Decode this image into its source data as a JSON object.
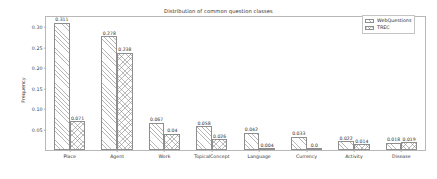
{
  "chart_data": {
    "type": "bar",
    "title": "Distribution of common question classes",
    "xlabel": "",
    "ylabel": "Frequency",
    "categories": [
      "Place",
      "Agent",
      "Work",
      "TopicalConcept",
      "Language",
      "Currency",
      "Activity",
      "Disease"
    ],
    "series": [
      {
        "name": "WebQuestions",
        "values": [
          0.311,
          0.278,
          0.067,
          0.058,
          0.042,
          0.033,
          0.022,
          0.018
        ],
        "labels": [
          "0.311",
          "0.278",
          "0.067",
          "0.058",
          "0.042",
          "0.033",
          "0.022",
          "0.018"
        ],
        "hatch": "diagonal"
      },
      {
        "name": "TREC",
        "values": [
          0.071,
          0.238,
          0.04,
          0.026,
          0.004,
          0.0,
          0.014,
          0.019
        ],
        "labels": [
          "0.071",
          "0.238",
          "0.04",
          "0.026",
          "0.004",
          "0.0",
          "0.014",
          "0.019"
        ],
        "hatch": "cross"
      }
    ],
    "ylim": [
      0.0,
      0.325
    ],
    "yticks": [
      0.05,
      0.1,
      0.15,
      0.2,
      0.25,
      0.3
    ],
    "ytick_labels": [
      "0.05",
      "0.10",
      "0.15",
      "0.20",
      "0.25",
      "0.30"
    ],
    "grid": false,
    "legend_position": "upper right",
    "bar_edge_color": "#8e8e8e",
    "bar_face_color": "#ffffff",
    "axes_color": "#b8b8b8",
    "text_color": "#303030"
  },
  "legend": {
    "entries": [
      "WebQuestions",
      "TREC"
    ]
  }
}
